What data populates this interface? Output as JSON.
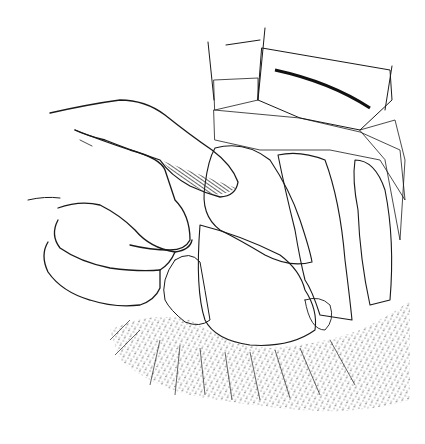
{
  "figure": {
    "description": "Black-and-white surgical line illustration: a gloved hand with index finger retracting tissue inside an opened abdominal cavity; a metal retractor blade at top right; tubular organs (bowel/vessels) with fine hatching; stippled peritoneal tissue at bottom.",
    "style": "pen-and-ink hatching",
    "colors": {
      "ink": "#1a1a1a",
      "background": "#ffffff"
    },
    "regions": [
      {
        "name": "hand",
        "label": "Hand with index finger"
      },
      {
        "name": "retractor",
        "label": "Retractor blade"
      },
      {
        "name": "fatty-mass",
        "label": "Lobulated tissue mass"
      },
      {
        "name": "tubular-organ-center",
        "label": "Central tubular organ"
      },
      {
        "name": "tubular-organ-right",
        "label": "Right tubular organ"
      },
      {
        "name": "rounded-organ",
        "label": "Rounded organ (lower center)"
      },
      {
        "name": "stippled-tissue",
        "label": "Surrounding stippled tissue"
      }
    ]
  }
}
